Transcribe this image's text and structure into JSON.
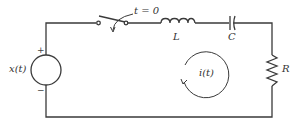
{
  "diagram": {
    "type": "series RLC circuit",
    "colors": {
      "wire": "#3a3a3a",
      "text": "#333333",
      "background": "#ffffff"
    },
    "source": {
      "label": "x(t)",
      "plus": "+",
      "minus": "−"
    },
    "switch": {
      "label": "t = 0"
    },
    "inductor": {
      "label": "L"
    },
    "capacitor": {
      "label": "C"
    },
    "resistor": {
      "label": "R"
    },
    "current": {
      "label": "i(t)",
      "direction": "clockwise"
    }
  }
}
